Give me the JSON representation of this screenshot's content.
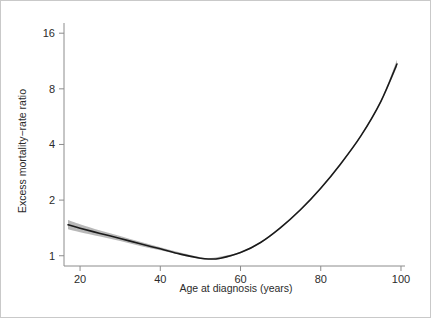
{
  "chart_data": {
    "type": "line",
    "title": "",
    "subtitle": "",
    "xlabel": "Age at diagnosis (years)",
    "ylabel": "Excess mortality−rate ratio",
    "yscale": "log2",
    "xlim": [
      16,
      101
    ],
    "ylim": [
      0.88,
      17.5
    ],
    "xticks": [
      20,
      40,
      60,
      80,
      100
    ],
    "xticklabels": [
      "20",
      "40",
      "60",
      "80",
      "100"
    ],
    "yticks": [
      1,
      2,
      4,
      8,
      16
    ],
    "yticklabels": [
      "1",
      "2",
      "4",
      "8",
      "16"
    ],
    "grid": false,
    "legend": "none",
    "annotations": [],
    "line_color": "#1a1a1a",
    "band_color": "#9a9a9a",
    "axis_color": "#8c8c8c",
    "series": [
      {
        "name": "Excess mortality-rate ratio",
        "x": [
          17,
          20,
          25,
          30,
          35,
          40,
          45,
          50,
          52,
          55,
          60,
          65,
          70,
          75,
          80,
          85,
          90,
          95,
          99
        ],
        "values": [
          1.47,
          1.41,
          1.32,
          1.24,
          1.16,
          1.09,
          1.02,
          0.97,
          0.96,
          0.97,
          1.04,
          1.18,
          1.42,
          1.78,
          2.32,
          3.15,
          4.45,
          6.85,
          10.9
        ],
        "ci_lower": [
          1.39,
          1.34,
          1.27,
          1.2,
          1.13,
          1.07,
          1.01,
          0.96,
          0.95,
          0.96,
          1.03,
          1.17,
          1.41,
          1.76,
          2.3,
          3.12,
          4.4,
          6.75,
          10.5
        ],
        "ci_upper": [
          1.56,
          1.48,
          1.37,
          1.28,
          1.19,
          1.11,
          1.04,
          0.98,
          0.97,
          0.99,
          1.05,
          1.19,
          1.44,
          1.8,
          2.34,
          3.18,
          4.5,
          6.95,
          11.5
        ]
      }
    ]
  }
}
